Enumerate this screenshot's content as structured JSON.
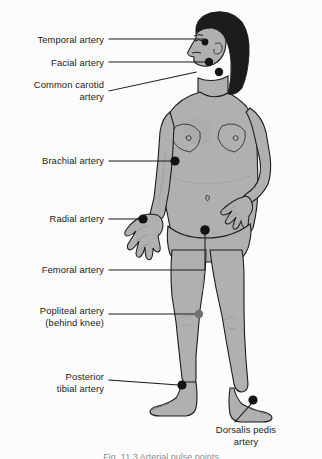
{
  "figure": {
    "background_color": "#fcfcfc",
    "skin_color": "#b0b0b0",
    "skin_shadow_color": "#9a9a9a",
    "hair_color": "#1c1c1c",
    "outline_color": "#1b1b1b",
    "leader_line_color": "#1b1b1b",
    "dot_color": "#141414",
    "hidden_dot_color": "#707070"
  },
  "labels": [
    {
      "id": "temporal",
      "text": "Temporal artery",
      "align": "right",
      "x": 8,
      "y": 34,
      "width": 96,
      "leader": "horizontal",
      "point_label": "temple, in front of ear"
    },
    {
      "id": "facial",
      "text": "Facial artery",
      "align": "right",
      "x": 8,
      "y": 57,
      "width": 96,
      "leader": "horizontal",
      "point_label": "jawline"
    },
    {
      "id": "common-carotid",
      "text": "Common carotid\nartery",
      "align": "right",
      "x": 8,
      "y": 79,
      "width": 96,
      "leader": "diagonal",
      "point_label": "side of neck"
    },
    {
      "id": "brachial",
      "text": "Brachial artery",
      "align": "right",
      "x": 8,
      "y": 155,
      "width": 96,
      "leader": "horizontal",
      "point_label": "inner upper arm"
    },
    {
      "id": "radial",
      "text": "Radial artery",
      "align": "right",
      "x": 8,
      "y": 213,
      "width": 96,
      "leader": "horizontal",
      "point_label": "wrist, thumb side"
    },
    {
      "id": "femoral",
      "text": "Femoral artery",
      "align": "right",
      "x": 8,
      "y": 264,
      "width": 96,
      "leader": "elbow",
      "point_label": "groin"
    },
    {
      "id": "popliteal",
      "text": "Popliteal artery\n(behind knee)",
      "align": "right",
      "x": 8,
      "y": 305,
      "width": 96,
      "leader": "horizontal",
      "point_label": "behind the knee"
    },
    {
      "id": "posterior-tibial",
      "text": "Posterior\ntibial artery",
      "align": "right",
      "x": 8,
      "y": 371,
      "width": 96,
      "leader": "horizontal",
      "point_label": "inner ankle"
    },
    {
      "id": "dorsalis-pedis",
      "text": "Dorsalis pedis\nartery",
      "align": "center",
      "x": 196,
      "y": 424,
      "width": 100,
      "leader": "diagonal",
      "point_label": "top of foot"
    }
  ],
  "pulse_points": [
    {
      "id": "temporal",
      "x": 205,
      "y": 42,
      "r": 3.4,
      "hidden": false
    },
    {
      "id": "facial",
      "x": 209,
      "y": 62,
      "r": 4.2,
      "hidden": false
    },
    {
      "id": "common-carotid",
      "x": 219,
      "y": 72,
      "r": 4.2,
      "hidden": false
    },
    {
      "id": "brachial",
      "x": 175,
      "y": 161,
      "r": 4.6,
      "hidden": false
    },
    {
      "id": "radial",
      "x": 143,
      "y": 219,
      "r": 4.6,
      "hidden": false
    },
    {
      "id": "femoral",
      "x": 205,
      "y": 230,
      "r": 4.8,
      "hidden": false
    },
    {
      "id": "popliteal",
      "x": 199,
      "y": 314,
      "r": 4.2,
      "hidden": true
    },
    {
      "id": "posterior-tibial",
      "x": 182,
      "y": 385,
      "r": 4.6,
      "hidden": false
    },
    {
      "id": "dorsalis-pedis",
      "x": 253,
      "y": 400,
      "r": 4.6,
      "hidden": false
    }
  ],
  "caption": {
    "text": "Fig. 11.3   Arterial pulse points",
    "visible": "clipped at bottom edge"
  }
}
